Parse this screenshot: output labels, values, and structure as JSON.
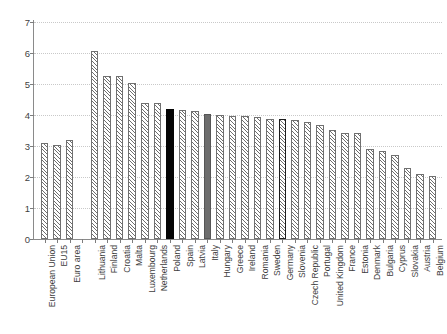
{
  "chart_data": {
    "type": "bar",
    "title": "",
    "subtitle": "",
    "xlabel": "",
    "ylabel": "",
    "ylim": [
      0,
      7
    ],
    "ytick_values": [
      0,
      1,
      2,
      3,
      4,
      5,
      6,
      7
    ],
    "ytick_labels": [
      "0",
      "1",
      "2",
      "3",
      "4",
      "5",
      "6",
      "7"
    ],
    "grid": true,
    "grid_axis": "y",
    "grid_style": "dotted",
    "legend": null,
    "legend_position": "none",
    "group_gap_after_index": 2,
    "categories": [
      "European Union",
      "EU15",
      "Euro area",
      "Lithuania",
      "Finland",
      "Croatia",
      "Malta",
      "Luxembourg",
      "Netherlands",
      "Poland",
      "Spain",
      "Latvia",
      "Italy",
      "Hungary",
      "Greece",
      "Ireland",
      "Romania",
      "Sweden",
      "Germany",
      "Slovenia",
      "Czech Republic",
      "Portugal",
      "United Kingdom",
      "France",
      "Estonia",
      "Denmark",
      "Bulgaria",
      "Cyprus",
      "Slovakia",
      "Austria",
      "Belgium"
    ],
    "values": [
      3.1,
      3.02,
      3.18,
      6.05,
      5.26,
      5.26,
      5.02,
      4.39,
      4.38,
      4.21,
      4.17,
      4.12,
      4.03,
      4.0,
      3.97,
      3.97,
      3.92,
      3.87,
      3.87,
      3.85,
      3.77,
      3.68,
      3.51,
      3.43,
      3.43,
      2.9,
      2.85,
      2.7,
      2.28,
      2.1,
      2.03
    ],
    "bar_styles": [
      "hatched",
      "hatched",
      "hatched",
      "hatched",
      "hatched",
      "hatched",
      "hatched",
      "hatched",
      "hatched",
      "solid-black",
      "hatched",
      "hatched",
      "solid-gray",
      "hatched",
      "hatched",
      "hatched",
      "hatched",
      "hatched",
      "thick-outline",
      "hatched",
      "hatched",
      "hatched",
      "hatched",
      "hatched",
      "hatched",
      "hatched",
      "hatched",
      "hatched",
      "hatched",
      "hatched",
      "hatched"
    ]
  },
  "colors": {
    "highlight_black": "#050505",
    "highlight_gray": "#6d6d6d",
    "hatch": "#6e6e6e",
    "bar_outline": "#707070",
    "axis": "#8a8a8a",
    "gridline": "#c9c9c9",
    "text": "#3d3d3d",
    "background": "#ffffff"
  }
}
